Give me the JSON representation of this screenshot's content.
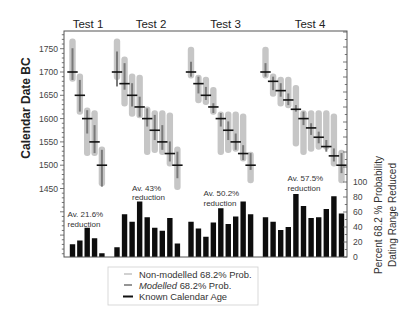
{
  "chart_data": {
    "type": "bar",
    "title": "",
    "panels": [
      "range plot (Calendar Date BC)",
      "bar chart (Percent 68.2% probability dating range reduced)"
    ],
    "y_left": {
      "label": "Calendar Date BC",
      "ticks": [
        1450,
        1500,
        1550,
        1600,
        1650,
        1700,
        1750
      ],
      "range": [
        1450,
        1790
      ]
    },
    "y_right": {
      "label_line1": "Percent 68.2 % Probability",
      "label_line2": "Dating Range Reduced",
      "ticks": [
        0,
        20,
        40,
        60,
        80,
        100
      ],
      "range": [
        0,
        100
      ]
    },
    "grid": false,
    "legend": {
      "position": "bottom-center",
      "items": [
        {
          "key": "non_modelled",
          "label": "Non-modelled 68.2% Prob.",
          "color": "#c6c6c6"
        },
        {
          "key": "modelled",
          "label_italic": "Modelled",
          "label_rest": " 68.2% Prob.",
          "color": "#7a7a7a"
        },
        {
          "key": "known",
          "label": "Known Calendar Age",
          "color": "#111111"
        }
      ]
    },
    "tests": [
      {
        "label": "Test 1",
        "annotation": {
          "line1": "Av. 21.6%",
          "line2": "reduction"
        },
        "average_reduction_pct": 21.6,
        "samples": [
          {
            "known": 1700,
            "non_modelled": [
              1772,
              1679
            ],
            "modelled": [
              1751,
              1683
            ],
            "reduction_pct": 17
          },
          {
            "known": 1650,
            "non_modelled": [
              1697,
              1608
            ],
            "modelled": [
              1683,
              1615
            ],
            "reduction_pct": 22
          },
          {
            "known": 1600,
            "non_modelled": [
              1624,
              1520
            ],
            "modelled": [
              1618,
              1568
            ],
            "reduction_pct": 39
          },
          {
            "known": 1550,
            "non_modelled": [
              1618,
              1520
            ],
            "modelled": [
              1586,
              1526
            ],
            "reduction_pct": 25
          },
          {
            "known": 1500,
            "non_modelled": [
              1540,
              1455
            ],
            "modelled": [
              1533,
              1454
            ],
            "reduction_pct": 5
          }
        ]
      },
      {
        "label": "Test 2",
        "annotation": {
          "line1": "Av. 43%",
          "line2": "reduction"
        },
        "average_reduction_pct": 43,
        "samples": [
          {
            "known": 1700,
            "non_modelled": [
              1772,
              1683
            ],
            "modelled": [
              1744,
              1669
            ],
            "reduction_pct": 13
          },
          {
            "known": 1675,
            "non_modelled": [
              1733,
              1626
            ],
            "modelled": [
              1719,
              1662
            ],
            "reduction_pct": 57
          },
          {
            "known": 1650,
            "non_modelled": [
              1697,
              1604
            ],
            "modelled": [
              1676,
              1626
            ],
            "reduction_pct": 47
          },
          {
            "known": 1625,
            "non_modelled": [
              1694,
              1601
            ],
            "modelled": [
              1647,
              1604
            ],
            "reduction_pct": 74
          },
          {
            "known": 1600,
            "non_modelled": [
              1626,
              1522
            ],
            "modelled": [
              1622,
              1583
            ],
            "reduction_pct": 53
          },
          {
            "known": 1575,
            "non_modelled": [
              1618,
              1526
            ],
            "modelled": [
              1608,
              1554
            ],
            "reduction_pct": 39
          },
          {
            "known": 1550,
            "non_modelled": [
              1618,
              1522
            ],
            "modelled": [
              1586,
              1533
            ],
            "reduction_pct": 35
          },
          {
            "known": 1525,
            "non_modelled": [
              1613,
              1497
            ],
            "modelled": [
              1551,
              1508
            ],
            "reduction_pct": 52
          },
          {
            "known": 1500,
            "non_modelled": [
              1540,
              1447
            ],
            "modelled": [
              1529,
              1472
            ],
            "reduction_pct": 18
          }
        ]
      },
      {
        "label": "Test 3",
        "annotation": {
          "line1": "Av. 50.2%",
          "line2": "reduction"
        },
        "average_reduction_pct": 50.2,
        "samples": [
          {
            "known": 1700,
            "non_modelled": [
              1754,
              1686
            ],
            "modelled": [
              1722,
              1690
            ],
            "reduction_pct": 47
          },
          {
            "known": 1675,
            "non_modelled": [
              1694,
              1633
            ],
            "modelled": [
              1690,
              1654
            ],
            "reduction_pct": 38
          },
          {
            "known": 1650,
            "non_modelled": [
              1690,
              1629
            ],
            "modelled": [
              1668,
              1640
            ],
            "reduction_pct": 27
          },
          {
            "known": 1625,
            "non_modelled": [
              1668,
              1608
            ],
            "modelled": [
              1633,
              1612
            ],
            "reduction_pct": 46
          },
          {
            "known": 1600,
            "non_modelled": [
              1615,
              1522
            ],
            "modelled": [
              1612,
              1583
            ],
            "reduction_pct": 65
          },
          {
            "known": 1575,
            "non_modelled": [
              1615,
              1526
            ],
            "modelled": [
              1594,
              1554
            ],
            "reduction_pct": 44
          },
          {
            "known": 1550,
            "non_modelled": [
              1615,
              1529
            ],
            "modelled": [
              1568,
              1533
            ],
            "reduction_pct": 54
          },
          {
            "known": 1525,
            "non_modelled": [
              1611,
              1508
            ],
            "modelled": [
              1543,
              1511
            ],
            "reduction_pct": 74
          },
          {
            "known": 1500,
            "non_modelled": [
              1529,
              1461
            ],
            "modelled": [
              1526,
              1490
            ],
            "reduction_pct": 57
          }
        ]
      },
      {
        "label": "Test 4",
        "annotation": {
          "line1": "Av. 57.5%",
          "line2": "reduction"
        },
        "average_reduction_pct": 57.5,
        "samples": [
          {
            "known": 1700,
            "non_modelled": [
              1754,
              1686
            ],
            "modelled": [
              1719,
              1690
            ],
            "reduction_pct": 53
          },
          {
            "known": 1680,
            "non_modelled": [
              1697,
              1647
            ],
            "modelled": [
              1690,
              1661
            ],
            "reduction_pct": 47
          },
          {
            "known": 1660,
            "non_modelled": [
              1690,
              1626
            ],
            "modelled": [
              1676,
              1647
            ],
            "reduction_pct": 36
          },
          {
            "known": 1640,
            "non_modelled": [
              1690,
              1622
            ],
            "modelled": [
              1654,
              1629
            ],
            "reduction_pct": 40
          },
          {
            "known": 1620,
            "non_modelled": [
              1672,
              1540
            ],
            "modelled": [
              1629,
              1615
            ],
            "reduction_pct": 84
          },
          {
            "known": 1600,
            "non_modelled": [
              1618,
              1522
            ],
            "modelled": [
              1615,
              1586
            ],
            "reduction_pct": 68
          },
          {
            "known": 1580,
            "non_modelled": [
              1618,
              1529
            ],
            "modelled": [
              1590,
              1565
            ],
            "reduction_pct": 52
          },
          {
            "known": 1560,
            "non_modelled": [
              1618,
              1533
            ],
            "modelled": [
              1572,
              1547
            ],
            "reduction_pct": 53
          },
          {
            "known": 1540,
            "non_modelled": [
              1618,
              1533
            ],
            "modelled": [
              1554,
              1529
            ],
            "reduction_pct": 64
          },
          {
            "known": 1520,
            "non_modelled": [
              1611,
              1497
            ],
            "modelled": [
              1536,
              1508
            ],
            "reduction_pct": 81
          },
          {
            "known": 1500,
            "non_modelled": [
              1533,
              1461
            ],
            "modelled": [
              1526,
              1483
            ],
            "reduction_pct": 58
          }
        ]
      }
    ],
    "colors": {
      "non_modelled": "#c6c6c6",
      "modelled": "#7a7a7a",
      "known": "#111111",
      "bars": "#0d0d0d",
      "axis": "#555555"
    }
  }
}
